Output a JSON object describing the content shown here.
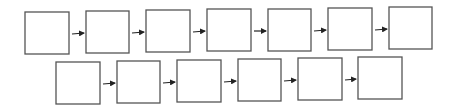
{
  "diagram": {
    "type": "flow-sequence",
    "colors": {
      "box_stroke": "#555555",
      "arrow": "#222222",
      "background": "#ffffff"
    },
    "rows": [
      {
        "boxes": [
          {
            "x": 25,
            "y": 12,
            "w": 44,
            "h": 42,
            "label": ""
          },
          {
            "x": 86,
            "y": 11,
            "w": 43,
            "h": 42,
            "label": ""
          },
          {
            "x": 146,
            "y": 10,
            "w": 44,
            "h": 42,
            "label": ""
          },
          {
            "x": 207,
            "y": 9,
            "w": 44,
            "h": 42,
            "label": ""
          },
          {
            "x": 268,
            "y": 9,
            "w": 43,
            "h": 42,
            "label": ""
          },
          {
            "x": 328,
            "y": 8,
            "w": 44,
            "h": 42,
            "label": ""
          },
          {
            "x": 389,
            "y": 7,
            "w": 43,
            "h": 42,
            "label": ""
          }
        ]
      },
      {
        "boxes": [
          {
            "x": 56,
            "y": 62,
            "w": 44,
            "h": 42,
            "label": ""
          },
          {
            "x": 117,
            "y": 61,
            "w": 43,
            "h": 42,
            "label": ""
          },
          {
            "x": 177,
            "y": 60,
            "w": 44,
            "h": 42,
            "label": ""
          },
          {
            "x": 238,
            "y": 59,
            "w": 43,
            "h": 42,
            "label": ""
          },
          {
            "x": 298,
            "y": 58,
            "w": 44,
            "h": 42,
            "label": ""
          },
          {
            "x": 358,
            "y": 57,
            "w": 44,
            "h": 42,
            "label": ""
          }
        ]
      }
    ]
  }
}
